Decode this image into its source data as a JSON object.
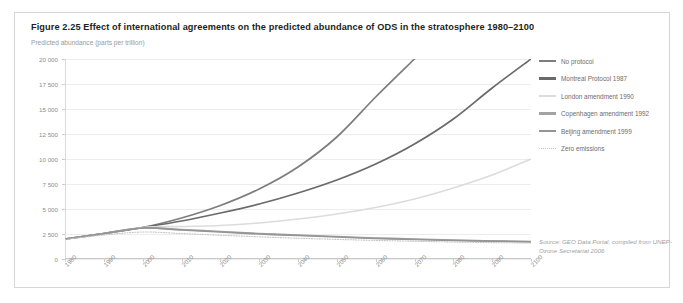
{
  "figure": {
    "title": "Figure 2.25 Effect of international agreements on the predicted abundance of ODS in the stratosphere 1980–2100",
    "source": "Source: GEO Data Portal, compiled from UNEP-Ozone Secretariat 2006"
  },
  "legend": {
    "items": [
      {
        "label": "No protocol",
        "color": "#7d7d7d",
        "style": "solid"
      },
      {
        "label": "Montreal Protocol 1987",
        "color": "#6a6a6a",
        "style": "solid"
      },
      {
        "label": "London amendment 1990",
        "color": "#dcdcdc",
        "style": "solid"
      },
      {
        "label": "Copenhagen amendment 1992",
        "color": "#a3a3a3",
        "style": "solid"
      },
      {
        "label": "Beijing amendment 1999",
        "color": "#949494",
        "style": "solid"
      },
      {
        "label": "Zero emissions",
        "color": "#c4c4c4",
        "style": "dotted"
      }
    ]
  },
  "chart_data": {
    "type": "line",
    "title": "Effect of international agreements on the predicted abundance of ODS in the stratosphere 1980–2100",
    "xlabel": "",
    "ylabel": "Predicted abundance (parts per trillion)",
    "xlim": [
      1980,
      2100
    ],
    "ylim": [
      0,
      20000
    ],
    "yticks": [
      0,
      2500,
      5000,
      7500,
      10000,
      12500,
      15000,
      17500,
      20000
    ],
    "ytick_labels": [
      "0",
      "2 500",
      "5 000",
      "7 500",
      "10 000",
      "12 500",
      "15 000",
      "17 500",
      "20 000"
    ],
    "xticks": [
      1980,
      1990,
      2000,
      2010,
      2020,
      2030,
      2040,
      2050,
      2060,
      2070,
      2080,
      2090,
      2100
    ],
    "xtick_labels": [
      "1980",
      "1990",
      "2000",
      "2010",
      "2020",
      "2030",
      "2040",
      "2050",
      "2060",
      "2070",
      "2080",
      "2090",
      "2100"
    ],
    "grid": true,
    "legend_position": "right",
    "x": [
      1980,
      1990,
      2000,
      2010,
      2020,
      2030,
      2040,
      2050,
      2060,
      2070,
      2080,
      2090,
      2100
    ],
    "series": [
      {
        "name": "No protocol",
        "color": "#7d7d7d",
        "values": [
          2000,
          2550,
          3150,
          4100,
          5350,
          7000,
          9200,
          12200,
          16200,
          20000,
          null,
          null,
          null
        ]
      },
      {
        "name": "Montreal Protocol 1987",
        "color": "#6a6a6a",
        "values": [
          2000,
          2550,
          3150,
          3800,
          4600,
          5500,
          6600,
          7900,
          9500,
          11500,
          14000,
          17100,
          20000
        ]
      },
      {
        "name": "London amendment 1990",
        "color": "#dcdcdc",
        "values": [
          2000,
          2550,
          3150,
          3250,
          3350,
          3600,
          4000,
          4500,
          5150,
          6000,
          7100,
          8400,
          10000
        ]
      },
      {
        "name": "Copenhagen amendment 1992",
        "color": "#a3a3a3",
        "values": [
          2000,
          2550,
          3100,
          2950,
          2750,
          2550,
          2400,
          2250,
          2100,
          2000,
          1900,
          1800,
          1750
        ]
      },
      {
        "name": "Beijing amendment 1999",
        "color": "#949494",
        "values": [
          2000,
          2550,
          3100,
          2900,
          2700,
          2500,
          2350,
          2200,
          2050,
          1950,
          1850,
          1780,
          1720
        ]
      },
      {
        "name": "Zero emissions",
        "color": "#c4c4c4",
        "style": "dotted",
        "values": [
          1950,
          2400,
          2700,
          2550,
          2380,
          2220,
          2080,
          1960,
          1860,
          1780,
          1700,
          1640,
          1600
        ]
      }
    ]
  }
}
